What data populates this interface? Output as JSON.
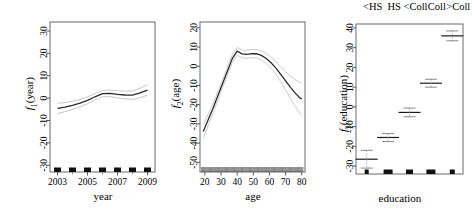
{
  "figure": {
    "panels": [
      {
        "id": "panel-year",
        "ylabel_main": "f",
        "ylabel_sub": "1",
        "ylabel_arg": "(year)",
        "xlabel": "year",
        "xticks": [
          "2003",
          "2005",
          "2007",
          "2009"
        ],
        "xtick_values": [
          2003,
          2005,
          2007,
          2009
        ],
        "xminor_values": [
          2004,
          2006,
          2008
        ],
        "yticks": [
          "30",
          "20",
          "10",
          "0",
          "-10",
          "-20",
          "-30"
        ],
        "ytick_values": [
          30,
          20,
          10,
          0,
          -10,
          -20,
          -30
        ],
        "xlim": [
          2002.5,
          2009.5
        ],
        "ylim": [
          -33,
          34
        ],
        "rug_values": [
          2003,
          2004,
          2005,
          2006,
          2007,
          2008,
          2009
        ],
        "chart_data": {
          "type": "line",
          "title": "",
          "xlabel": "year",
          "ylabel": "f1(year)",
          "xlim": [
            2002.5,
            2009.5
          ],
          "ylim": [
            -33,
            34
          ],
          "grid": false,
          "legend": "none",
          "x": [
            2003,
            2003.5,
            2004,
            2004.5,
            2005,
            2005.5,
            2006,
            2006.5,
            2007,
            2007.5,
            2008,
            2008.5,
            2009
          ],
          "series": [
            {
              "name": "fit",
              "values": [
                -4.6,
                -4.0,
                -3.2,
                -2.2,
                -1.0,
                0.6,
                2.0,
                2.1,
                1.7,
                1.4,
                1.3,
                2.3,
                3.6
              ]
            },
            {
              "name": "upper CI",
              "values": [
                -2.3,
                -2.0,
                -1.4,
                -0.5,
                0.5,
                2.0,
                3.4,
                3.6,
                3.3,
                3.1,
                3.2,
                4.4,
                5.9
              ]
            },
            {
              "name": "lower CI",
              "values": [
                -6.9,
                -6.0,
                -5.0,
                -3.9,
                -2.5,
                -0.8,
                0.6,
                0.6,
                0.1,
                -0.3,
                -0.6,
                0.2,
                1.3
              ]
            }
          ]
        }
      },
      {
        "id": "panel-age",
        "ylabel_main": "f",
        "ylabel_sub": "2",
        "ylabel_arg": "(age)",
        "xlabel": "age",
        "xticks": [
          "20",
          "30",
          "40",
          "50",
          "60",
          "70",
          "80"
        ],
        "xtick_values": [
          20,
          30,
          40,
          50,
          60,
          70,
          80
        ],
        "yticks": [
          "20",
          "10",
          "0",
          "-10",
          "-20",
          "-30",
          "-40",
          "-50"
        ],
        "ytick_values": [
          20,
          10,
          0,
          -10,
          -20,
          -30,
          -40,
          -50
        ],
        "xlim": [
          17,
          82
        ],
        "ylim": [
          -55,
          23
        ],
        "chart_data": {
          "type": "line",
          "title": "",
          "xlabel": "age",
          "ylabel": "f2(age)",
          "xlim": [
            17,
            82
          ],
          "ylim": [
            -55,
            23
          ],
          "grid": false,
          "legend": "none",
          "x": [
            19,
            22,
            25,
            28,
            31,
            34,
            37,
            40,
            43,
            46,
            49,
            52,
            55,
            58,
            61,
            64,
            67,
            70,
            73,
            76,
            79,
            80
          ],
          "series": [
            {
              "name": "fit",
              "values": [
                -34.0,
                -28.0,
                -22.0,
                -15.5,
                -9.0,
                -2.5,
                4.0,
                7.8,
                6.4,
                6.2,
                6.6,
                6.5,
                5.6,
                4.0,
                1.8,
                -1.0,
                -4.2,
                -7.6,
                -11.0,
                -14.0,
                -16.6,
                -17.0
              ]
            },
            {
              "name": "upper CI",
              "values": [
                -30.5,
                -25.0,
                -19.4,
                -13.2,
                -6.9,
                -0.4,
                6.0,
                9.8,
                8.4,
                8.3,
                8.7,
                8.7,
                8.0,
                6.6,
                4.7,
                2.3,
                -0.3,
                -2.8,
                -5.2,
                -7.0,
                -8.6,
                -9.0
              ]
            },
            {
              "name": "lower CI",
              "values": [
                -37.5,
                -31.0,
                -24.6,
                -17.8,
                -11.1,
                -4.6,
                2.0,
                5.8,
                4.4,
                4.1,
                4.5,
                4.3,
                3.2,
                1.4,
                -1.1,
                -4.3,
                -8.1,
                -12.4,
                -16.8,
                -21.0,
                -24.6,
                -25.5
              ]
            }
          ]
        }
      },
      {
        "id": "panel-education",
        "ylabel_main": "f",
        "ylabel_sub": "3",
        "ylabel_arg": "(education)",
        "xlabel": "education",
        "toplabels": [
          "<HS",
          "HS",
          "<Coll",
          "Coll",
          ">Coll"
        ],
        "yticks": [
          "40",
          "30",
          "20",
          "10",
          "0",
          "-10",
          "-20",
          "-30"
        ],
        "ytick_values": [
          40,
          30,
          20,
          10,
          0,
          -10,
          -20,
          -30
        ],
        "ylim": [
          -34,
          42
        ],
        "chart_data": {
          "type": "scatter",
          "title": "",
          "xlabel": "education",
          "ylabel": "f3(education)",
          "ylim": [
            -34,
            42
          ],
          "grid": false,
          "legend": "none",
          "categories": [
            "<HS",
            "HS",
            "<Coll",
            "Coll",
            ">Coll"
          ],
          "values": [
            -26.5,
            -15.5,
            -2.8,
            12.0,
            36.0
          ],
          "ci_upper": [
            -22.0,
            -13.5,
            -0.6,
            14.0,
            38.5
          ],
          "ci_lower": [
            -31.0,
            -17.6,
            -5.0,
            10.0,
            33.5
          ],
          "rug_widths": [
            4,
            9,
            7,
            9,
            5
          ]
        }
      }
    ]
  }
}
